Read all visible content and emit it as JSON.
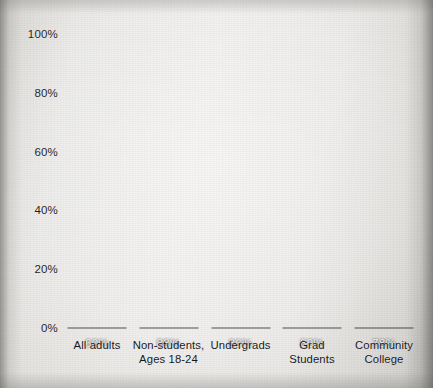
{
  "chart_data": {
    "type": "bar",
    "title": "",
    "subtitle": "",
    "xlabel": "",
    "ylabel": "",
    "ylim": [
      0,
      100
    ],
    "grid": false,
    "legend": "none",
    "value_label_position": "inside-top",
    "categories": [
      "All adults",
      "Non-students, Ages 18-24",
      "Undergrads",
      "Grad Students",
      "Community College"
    ],
    "category_lines": [
      [
        "All adults"
      ],
      [
        "Non-students,",
        "Ages 18-24"
      ],
      [
        "Undergrads"
      ],
      [
        "Grad",
        "Students"
      ],
      [
        "Community",
        "College"
      ]
    ],
    "values": [
      60,
      88,
      86,
      82,
      78
    ],
    "value_labels": [
      "60%",
      "88%",
      "86%",
      "82%",
      "78%"
    ],
    "y_ticks": [
      0,
      20,
      40,
      60,
      80,
      100
    ],
    "y_tick_labels": [
      "0%",
      "20%",
      "40%",
      "60%",
      "80%",
      "100%"
    ]
  },
  "colors": {
    "bar": "#101011",
    "background": "#e9e7e4",
    "axis_text": "#1e1e1e",
    "value_text": "#f2f2f0"
  }
}
